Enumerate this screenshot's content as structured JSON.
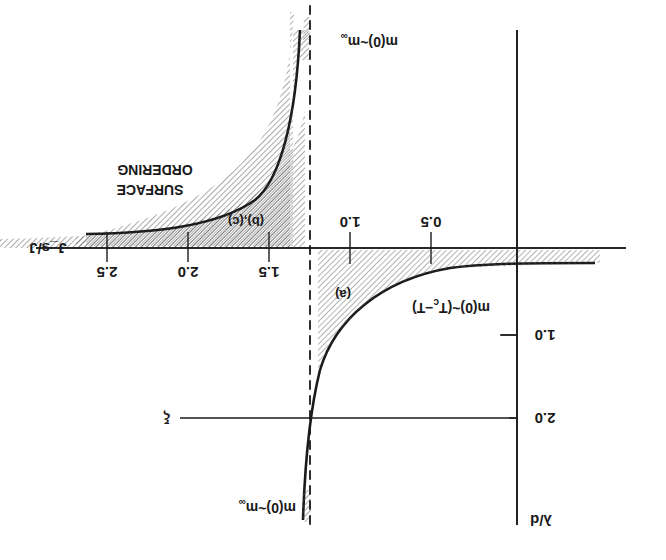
{
  "figure": {
    "orientation": "rotated 180 degrees",
    "axes": {
      "x_label": "J_s/J",
      "y_label": "λ/d",
      "x_ticks": [
        "0.5",
        "1.0",
        "1.5",
        "2.0",
        "2.5"
      ],
      "y_ticks": [
        "1.0",
        "2.0"
      ]
    },
    "annotations": {
      "region_a": "(a)",
      "region_bc": "(b),(c)",
      "surface_ordering_line1": "SURFACE",
      "surface_ordering_line2": "ORDERING",
      "critical_law": "m(0)~(T",
      "critical_law_sub": "c",
      "critical_law_end": "−T)",
      "m_inf_top": "m(0)~m",
      "m_inf_top_sub": "∞",
      "m_inf_bottom": "m(0)~m",
      "m_inf_bottom_sub": "∞",
      "xi_label": "ξ"
    },
    "colors": {
      "ink": "#1a1a1a",
      "background": "#ffffff"
    }
  }
}
